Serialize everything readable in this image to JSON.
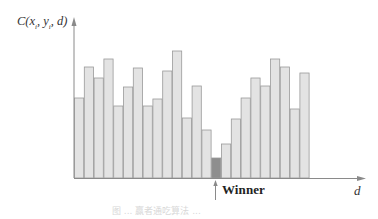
{
  "chart_data": {
    "type": "bar",
    "title": "",
    "xlabel": "d",
    "ylabel": "C(x_i, y_i, d)",
    "ylabel_parts": {
      "fn": "C",
      "args": [
        "x",
        "i",
        "y",
        "i",
        "d"
      ]
    },
    "categories": [
      "1",
      "2",
      "3",
      "4",
      "5",
      "6",
      "7",
      "8",
      "9",
      "10",
      "11",
      "12",
      "13",
      "14",
      "15",
      "16",
      "17",
      "18",
      "19",
      "20",
      "21",
      "22",
      "23",
      "24"
    ],
    "values": [
      80,
      111,
      100,
      119,
      72,
      91,
      110,
      72,
      79,
      107,
      127,
      60,
      92,
      48,
      20,
      34,
      59,
      80,
      100,
      92,
      119,
      111,
      69,
      105
    ],
    "winner_index": 14,
    "annotation": "Winner",
    "grid": false,
    "legend": null,
    "ylim": [
      0,
      140
    ],
    "colors": {
      "bar_fill": "#e3e3e3",
      "bar_stroke": "#9a9a9a",
      "winner_fill": "#8e8e8e",
      "axis": "#8a8a8a"
    }
  },
  "labels": {
    "y_fn": "C(",
    "y_x": "x",
    "y_sub1": "i",
    "y_sep": ", ",
    "y_y": "y",
    "y_sub2": "i",
    "y_d": ", d)",
    "x_axis": "d",
    "winner": "Winner",
    "caption": "图 ... 赢者通吃算法 ..."
  }
}
